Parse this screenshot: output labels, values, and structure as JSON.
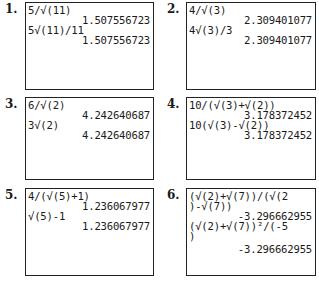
{
  "panels": [
    {
      "number": "1.",
      "lines": [
        {
          "type": "expr",
          "text": "5/√(11)"
        },
        {
          "type": "result",
          "text": "1.507556723"
        },
        {
          "type": "expr",
          "text": "5√(11)/11"
        },
        {
          "type": "result",
          "text": "1.507556723"
        }
      ]
    },
    {
      "number": "2.",
      "lines": [
        {
          "type": "expr",
          "text": "4/√(3)"
        },
        {
          "type": "result",
          "text": "2.309401077"
        },
        {
          "type": "expr",
          "text": "4√(3)/3"
        },
        {
          "type": "result",
          "text": "2.309401077"
        }
      ]
    },
    {
      "number": "3.",
      "lines": [
        {
          "type": "expr",
          "text": "6/√(2)"
        },
        {
          "type": "result",
          "text": "4.242640687"
        },
        {
          "type": "expr",
          "text": "3√(2)"
        },
        {
          "type": "result",
          "text": "4.242640687"
        }
      ]
    },
    {
      "number": "4.",
      "lines": [
        {
          "type": "expr",
          "text": "10/(√(3)+√(2))"
        },
        {
          "type": "result",
          "text": "3.178372452"
        },
        {
          "type": "expr",
          "text": "10(√(3)-√(2))"
        },
        {
          "type": "result",
          "text": "3.178372452"
        }
      ]
    },
    {
      "number": "5.",
      "lines": [
        {
          "type": "expr",
          "text": "4/(√(5)+1)"
        },
        {
          "type": "result",
          "text": "1.236067977"
        },
        {
          "type": "expr",
          "text": "√(5)-1"
        },
        {
          "type": "result",
          "text": "1.236067977"
        }
      ]
    },
    {
      "number": "6.",
      "lines": [
        {
          "type": "expr",
          "text": "(√(2)+√(7))/(√(2"
        },
        {
          "type": "expr",
          "text": ")-√(7))"
        },
        {
          "type": "result",
          "text": "-3.296662955"
        },
        {
          "type": "expr",
          "text": "(√(2)+√(7))²/(-5"
        },
        {
          "type": "expr",
          "text": ")"
        },
        {
          "type": "result",
          "text": "-3.296662955"
        }
      ]
    }
  ]
}
